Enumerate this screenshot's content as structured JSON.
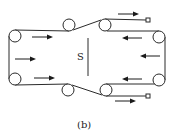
{
  "figure": {
    "caption": "(b)",
    "center_label": "S",
    "colors": {
      "line": "#2a2a2a",
      "arrow": "#1a1a1a",
      "background": "#ffffff"
    },
    "rollers": [
      {
        "id": "left-top",
        "cx": 15,
        "cy": 36,
        "r": 6
      },
      {
        "id": "left-bottom",
        "cx": 15,
        "cy": 79,
        "r": 6
      },
      {
        "id": "top-mid",
        "cx": 69,
        "cy": 25,
        "r": 6
      },
      {
        "id": "top-right-mid",
        "cx": 105,
        "cy": 25,
        "r": 6
      },
      {
        "id": "bottom-mid",
        "cx": 68,
        "cy": 90,
        "r": 6
      },
      {
        "id": "bottom-right-mid",
        "cx": 106,
        "cy": 90,
        "r": 6
      },
      {
        "id": "right-top",
        "cx": 159,
        "cy": 37,
        "r": 6
      },
      {
        "id": "right-bottom",
        "cx": 159,
        "cy": 80,
        "r": 6
      }
    ],
    "arrows": [
      {
        "id": "top-feed",
        "direction": "right",
        "x1": 118,
        "x2": 138,
        "y": 14
      },
      {
        "id": "left-upper",
        "direction": "right",
        "x1": 32,
        "x2": 52,
        "y": 37
      },
      {
        "id": "left-middle",
        "direction": "right",
        "x1": 15,
        "x2": 35,
        "y": 59
      },
      {
        "id": "left-lower",
        "direction": "right",
        "x1": 34,
        "x2": 54,
        "y": 78
      },
      {
        "id": "right-upper",
        "direction": "left",
        "x1": 142,
        "x2": 122,
        "y": 38
      },
      {
        "id": "right-middle",
        "direction": "left",
        "x1": 160,
        "x2": 140,
        "y": 56
      },
      {
        "id": "right-lower",
        "direction": "left",
        "x1": 142,
        "x2": 122,
        "y": 79
      },
      {
        "id": "bottom-feed",
        "direction": "right",
        "x1": 115,
        "x2": 135,
        "y": 101
      }
    ],
    "end_markers": [
      {
        "id": "top-end",
        "x": 146,
        "y": 18
      },
      {
        "id": "bottom-end",
        "x": 146,
        "y": 94
      }
    ]
  }
}
